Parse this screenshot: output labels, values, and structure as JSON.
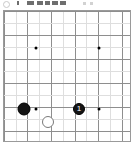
{
  "app": {
    "title": "Go Board",
    "background_color": "#ffffff"
  },
  "toolbar": {
    "stone_indicator": {
      "icon": "circle-outline-icon",
      "label": "White to play",
      "color": "#ffffff",
      "border_color": "#c9c9c9"
    },
    "buttons": [
      {
        "icon": "toolbar-button-icon",
        "label": "",
        "x": 17,
        "w": 2,
        "color": "#6e6e6e"
      },
      {
        "icon": "toolbar-button-icon",
        "label": "",
        "x": 27,
        "w": 7,
        "color": "#6e6e6e"
      },
      {
        "icon": "toolbar-button-icon",
        "label": "",
        "x": 37,
        "w": 6,
        "color": "#6e6e6e"
      },
      {
        "icon": "toolbar-button-icon",
        "label": "",
        "x": 45,
        "w": 5,
        "color": "#6e6e6e"
      },
      {
        "icon": "toolbar-button-icon",
        "label": "",
        "x": 52,
        "w": 6,
        "color": "#6e6e6e"
      },
      {
        "icon": "toolbar-button-icon",
        "label": "",
        "x": 60,
        "w": 6,
        "color": "#6e6e6e"
      }
    ],
    "faint_buttons": [
      {
        "icon": "toolbar-button-icon",
        "x": 83,
        "w": 3,
        "color": "#d2d2d2"
      },
      {
        "icon": "toolbar-button-icon",
        "x": 90,
        "w": 3,
        "color": "#d2d2d2"
      }
    ]
  },
  "board": {
    "name": "go-board",
    "frame_color": "#9a9a9a",
    "line_color": "#8e8e8e",
    "faint_line_color": "#dedede",
    "origin_x": 3,
    "origin_y": 1,
    "spacing": 11.8,
    "columns": 11,
    "rows": 11,
    "vertical_lines": [
      {
        "x": 0,
        "faint": false
      },
      {
        "x": 12,
        "faint": true
      },
      {
        "x": 23,
        "faint": false
      },
      {
        "x": 35,
        "faint": true
      },
      {
        "x": 47,
        "faint": false
      },
      {
        "x": 59,
        "faint": true
      },
      {
        "x": 71,
        "faint": false
      },
      {
        "x": 82,
        "faint": true
      },
      {
        "x": 94,
        "faint": false
      },
      {
        "x": 106,
        "faint": true
      },
      {
        "x": 118,
        "faint": false
      }
    ],
    "horizontal_lines": [
      {
        "y": 0,
        "faint": false
      },
      {
        "y": 12,
        "faint": true
      },
      {
        "y": 24,
        "faint": false
      },
      {
        "y": 36,
        "faint": true
      },
      {
        "y": 48,
        "faint": false
      },
      {
        "y": 60,
        "faint": true
      },
      {
        "y": 72,
        "faint": false
      },
      {
        "y": 84,
        "faint": true
      },
      {
        "y": 96,
        "faint": false
      },
      {
        "y": 108,
        "faint": true
      },
      {
        "y": 120,
        "faint": false
      }
    ],
    "star_points": [
      {
        "name": "hoshi-upper-left",
        "x": 32,
        "y": 37
      },
      {
        "name": "hoshi-upper-right",
        "x": 95,
        "y": 37
      },
      {
        "name": "hoshi-lower-left",
        "x": 32,
        "y": 98
      },
      {
        "name": "hoshi-lower-right",
        "x": 95,
        "y": 98
      }
    ],
    "stones": [
      {
        "name": "black-stone",
        "color": "black",
        "x": 20,
        "y": 98,
        "size": 13,
        "label": ""
      },
      {
        "name": "black-stone-move-1",
        "color": "black",
        "x": 75,
        "y": 98,
        "size": 12,
        "label": "1"
      },
      {
        "name": "white-stone",
        "color": "white",
        "x": 44,
        "y": 111,
        "size": 12,
        "label": ""
      }
    ]
  }
}
